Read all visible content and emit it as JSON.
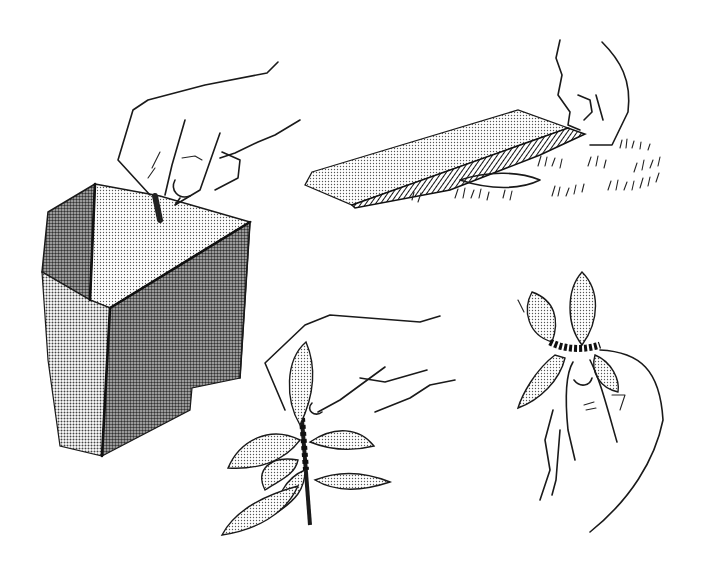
{
  "illustration": {
    "style": "black-and-white pen drawing with halftone dot shading",
    "background": "#ffffff",
    "ink_color": "#1a1a1a",
    "panels": [
      {
        "id": "box",
        "description": "hand dropping a caterpillar into an open cardboard box"
      },
      {
        "id": "board",
        "description": "hand lifting a board lying on grass"
      },
      {
        "id": "stem",
        "description": "hand holding a leafy plant stem with insects clustered on it"
      },
      {
        "id": "leaf-cluster",
        "description": "hand holding leaves bound together with insects"
      }
    ]
  }
}
